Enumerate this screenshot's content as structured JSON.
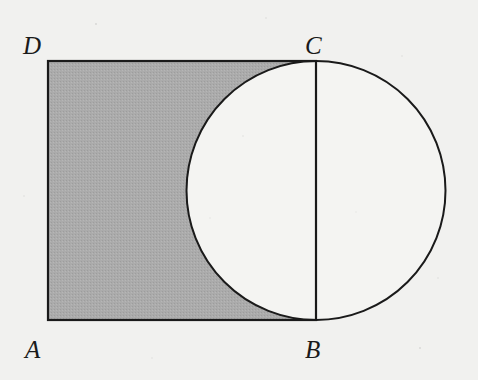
{
  "figure": {
    "background_color": "#f1f1ef",
    "stroke_color": "#1a1a1a",
    "shade_color": "#aaaaaa",
    "circle_fill_color": "#f4f4f2",
    "labels": {
      "A": "A",
      "B": "B",
      "C": "C",
      "D": "D"
    },
    "geometry": {
      "rectangle": {
        "name": "ABCD",
        "x": 48,
        "y": 61,
        "width": 268,
        "height": 259,
        "corner_A": [
          48,
          320
        ],
        "corner_B": [
          316,
          320
        ],
        "corner_C": [
          316,
          61
        ],
        "corner_D": [
          48,
          61
        ]
      },
      "circle": {
        "center": [
          316,
          190.5
        ],
        "radius": 129.5,
        "diameter_endpoints": [
          [
            316,
            61
          ],
          [
            316,
            320
          ]
        ],
        "diameter_segment": "CB"
      },
      "shaded_region": "rectangle ABCD minus left half of circle",
      "chord_line": "CB vertical diameter"
    }
  }
}
